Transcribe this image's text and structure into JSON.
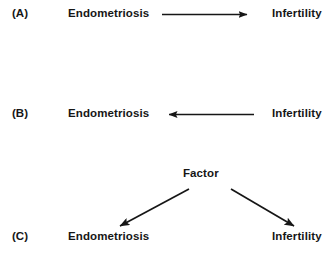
{
  "figure": {
    "background_color": "#ffffff",
    "stroke_color": "#161616",
    "text_color": "#161616"
  },
  "panels": [
    {
      "id": "A",
      "label": "(A)",
      "left_node": "Endometriosis",
      "right_node": "Infertility",
      "arrow_direction": "right",
      "meaning": "Endometriosis causes infertility"
    },
    {
      "id": "B",
      "label": "(B)",
      "left_node": "Endometriosis",
      "right_node": "Infertility",
      "arrow_direction": "left",
      "meaning": "Infertility causes endometriosis"
    },
    {
      "id": "C",
      "label": "(C)",
      "top_node": "Factor",
      "left_node": "Endometriosis",
      "right_node": "Infertility",
      "arrow_direction": "branching-down",
      "meaning": "A common factor causes both endometriosis and infertility"
    }
  ]
}
